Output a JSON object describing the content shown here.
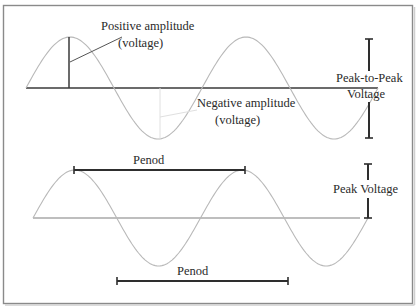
{
  "diagram": {
    "top_panel": {
      "positive_amplitude_label": [
        "Positive amplitude",
        "(voltage)"
      ],
      "negative_amplitude_label": [
        "Negative amplitude",
        "(voltage)"
      ],
      "peak_to_peak_label": [
        "Peak-to-Peak",
        "Voltage"
      ],
      "cycles_shown": 2.0
    },
    "bottom_panel": {
      "period_label_upper": "Penod",
      "period_label_lower": "Penod",
      "peak_voltage_label": "Peak Voltage",
      "cycles_shown": 2.0
    },
    "colors": {
      "wave": "#b8b8b8",
      "axis": "#3a3a3a",
      "frame": "#8a8a8a",
      "text": "#2a2a2a"
    }
  }
}
